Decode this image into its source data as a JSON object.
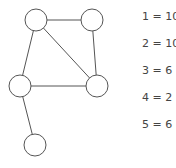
{
  "graph": {
    "nodes": [
      {
        "id": "A",
        "label": ""
      },
      {
        "id": "B",
        "label": ""
      },
      {
        "id": "C",
        "label": ""
      },
      {
        "id": "D",
        "label": ""
      },
      {
        "id": "E",
        "label": ""
      }
    ],
    "edges": [
      {
        "from": "A",
        "to": "B"
      },
      {
        "from": "A",
        "to": "C"
      },
      {
        "from": "A",
        "to": "D"
      },
      {
        "from": "B",
        "to": "D"
      },
      {
        "from": "C",
        "to": "D"
      },
      {
        "from": "C",
        "to": "E"
      }
    ],
    "stroke_color": "#555555",
    "fill_color": "#ffffff"
  },
  "legend": {
    "items": [
      {
        "text": "1 = 10"
      },
      {
        "text": "2 = 10"
      },
      {
        "text": "3 = 6"
      },
      {
        "text": "4 = 2"
      },
      {
        "text": "5 = 6"
      }
    ]
  }
}
